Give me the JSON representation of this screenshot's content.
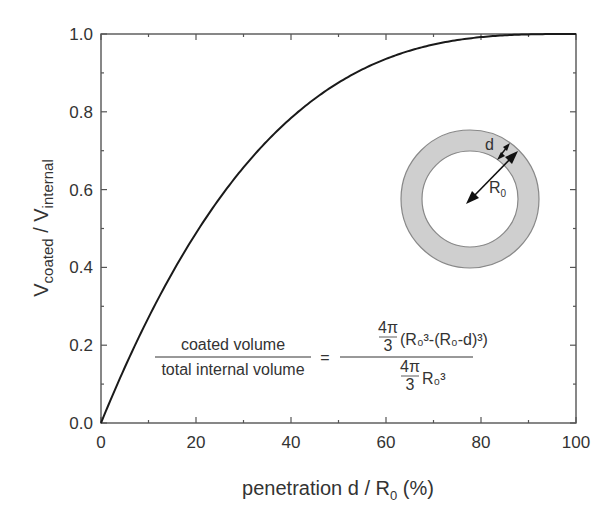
{
  "chart_data": {
    "type": "line",
    "title": "",
    "xlabel": "penetration d / R0 (%)",
    "ylabel": "Vcoated / Vinternal",
    "xlim": [
      0,
      100
    ],
    "ylim": [
      0.0,
      1.0
    ],
    "grid": false,
    "legend": null,
    "x_ticks": [
      "0",
      "20",
      "40",
      "60",
      "80",
      "100"
    ],
    "y_ticks": [
      "0.0",
      "0.2",
      "0.4",
      "0.6",
      "0.8",
      "1.0"
    ],
    "series": [
      {
        "name": "coated volume fraction",
        "formula": "1 - (1 - d/R0)^3",
        "x": [
          0,
          5,
          10,
          15,
          20,
          25,
          30,
          35,
          40,
          45,
          50,
          55,
          60,
          65,
          70,
          75,
          80,
          85,
          90,
          95,
          100
        ],
        "y": [
          0.0,
          0.143,
          0.271,
          0.386,
          0.488,
          0.578,
          0.657,
          0.725,
          0.784,
          0.834,
          0.875,
          0.909,
          0.936,
          0.957,
          0.973,
          0.984,
          0.992,
          0.997,
          0.999,
          1.0,
          1.0
        ]
      }
    ],
    "annotations": [
      {
        "type": "equation",
        "text": "coated volume / total internal volume = (4π/3)(R0³-(R0-d)³) / ((4π/3)R0³)"
      },
      {
        "type": "diagram",
        "text": "annulus with inner radius R0 and shell thickness d"
      }
    ]
  },
  "axes": {
    "x_title_main": "penetration d / R",
    "x_title_sub": "0",
    "x_title_tail": " (%)",
    "y_title_main": "V",
    "y_title_sub1": "coated",
    "y_title_mid": " / V",
    "y_title_sub2": "internal"
  },
  "equation": {
    "lhs_num": "coated volume",
    "lhs_den": "total internal volume",
    "equals": "=",
    "rhs_num_frac_top": "4π",
    "rhs_num_frac_bot": "3",
    "rhs_num_expr": "(R₀³-(R₀-d)³)",
    "rhs_den_frac_top": "4π",
    "rhs_den_frac_bot": "3",
    "rhs_den_expr": "R₀³"
  },
  "diagram": {
    "label_d": "d",
    "label_r": "R",
    "label_r_sub": "0",
    "shell_color": "#cfcfcf"
  },
  "colors": {
    "line": "#1a1a1a",
    "axis": "#555555"
  }
}
